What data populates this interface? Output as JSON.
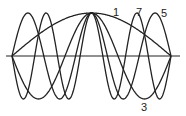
{
  "diagram": {
    "title": "",
    "type": "standing-wave-modes",
    "axis": {
      "x1": 6,
      "x2": 180,
      "y": 56
    },
    "span": {
      "x_start": 12,
      "x_end": 171,
      "amplitude": 43
    },
    "stroke_color": "#222222",
    "modes": [
      {
        "n": 1,
        "label": "1",
        "label_x": 113,
        "label_y": 16
      },
      {
        "n": 3,
        "label": "3",
        "label_x": 141,
        "label_y": 111
      },
      {
        "n": 5,
        "label": "5",
        "label_x": 161,
        "label_y": 17
      },
      {
        "n": 7,
        "label": "7",
        "label_x": 136,
        "label_y": 16
      }
    ]
  }
}
